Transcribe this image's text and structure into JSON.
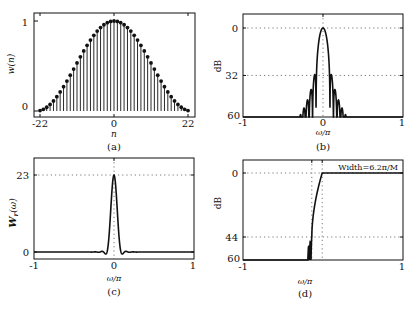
{
  "chart_data": [
    {
      "id": "a",
      "type": "stem",
      "caption": "(a)",
      "title": "",
      "xlabel": "n",
      "ylabel": "w(n)",
      "xlim": [
        -22,
        22
      ],
      "ylim": [
        0,
        1
      ],
      "xticks": [
        -22,
        0,
        22
      ],
      "xtick_labels": [
        "-22",
        "0",
        "22"
      ],
      "yticks": [
        0,
        1
      ],
      "ytick_labels": [
        "0",
        "1"
      ],
      "grid": false,
      "description": "Hann-like window, 45 samples n=-22..22, w(n)=0.5+0.5cos(pi n/23)",
      "n": [
        -22,
        -21,
        -20,
        -19,
        -18,
        -17,
        -16,
        -15,
        -14,
        -13,
        -12,
        -11,
        -10,
        -9,
        -8,
        -7,
        -6,
        -5,
        -4,
        -3,
        -2,
        -1,
        0,
        1,
        2,
        3,
        4,
        5,
        6,
        7,
        8,
        9,
        10,
        11,
        12,
        13,
        14,
        15,
        16,
        17,
        18,
        19,
        20,
        21,
        22
      ],
      "window_M": 23
    },
    {
      "id": "b",
      "type": "line",
      "caption": "(b)",
      "xlabel": "ω/π",
      "ylabel": "dB",
      "xlim": [
        -1,
        1
      ],
      "ylim": [
        60,
        0
      ],
      "xticks": [
        -1,
        0,
        1
      ],
      "xtick_labels": [
        "-1",
        "0",
        "1"
      ],
      "yticks": [
        0,
        32,
        60
      ],
      "ytick_labels": [
        "0",
        "32",
        "60"
      ],
      "grid": "dotted at y=0, y=32, x=0",
      "description": "Log magnitude of window spectrum; main lobe ±0.087π, first sidelobe ≈ -32 dB, clipped at -60 dB beyond |ω/π|≈0.3",
      "mainlobe_halfwidth": 0.087,
      "first_sidelobe_db": -32,
      "floor_db": -60
    },
    {
      "id": "c",
      "type": "line",
      "caption": "(c)",
      "xlabel": "ω/π",
      "ylabel": "W_r(ω)",
      "xlim": [
        -1,
        1
      ],
      "ylim": [
        -2,
        26
      ],
      "xticks": [
        -1,
        0,
        1
      ],
      "xtick_labels": [
        "-1",
        "0",
        "1"
      ],
      "yticks": [
        0,
        23
      ],
      "ytick_labels": [
        "0",
        "23"
      ],
      "grid": "dotted at y=23, y=0, x=0",
      "description": "Real amplitude response of window; peak 23 at ω=0, near zero elsewhere",
      "peak": 23
    },
    {
      "id": "d",
      "type": "line",
      "caption": "(d)",
      "xlabel": "ω/π",
      "ylabel": "dB",
      "xlim": [
        -1,
        1
      ],
      "ylim": [
        60,
        0
      ],
      "xticks": [
        -1,
        1
      ],
      "xtick_labels": [
        "-1",
        "1"
      ],
      "yticks": [
        0,
        44,
        60
      ],
      "ytick_labels": [
        "0",
        "44",
        "60"
      ],
      "grid": "dotted at y=0, y=44, x≈-0.14, x≈-0.01",
      "annotation": "Width=6.2π/M",
      "description": "Lowpass filter log magnitude; stopband attenuation ≈ 44 dB, transition width 6.2π/M, passband 0 dB",
      "transition_start": -0.14,
      "transition_end": -0.01,
      "stopband_db": -44
    }
  ],
  "panels": {
    "a": {
      "caption": "(a)",
      "xlabel": "n",
      "ylabel": "w(n)",
      "yt": [
        "0",
        "1"
      ],
      "xt": [
        "-22",
        "0",
        "22"
      ]
    },
    "b": {
      "caption": "(b)",
      "xlabel": "ω/π",
      "ylabel": "dB",
      "yt": [
        "0",
        "32",
        "60"
      ],
      "xt": [
        "-1",
        "0",
        "1"
      ]
    },
    "c": {
      "caption": "(c)",
      "xlabel": "ω/π",
      "ylabel_main": "W",
      "ylabel_sub": "r",
      "ylabel_arg": "(ω)",
      "yt": [
        "0",
        "23"
      ],
      "xt": [
        "-1",
        "0",
        "1"
      ]
    },
    "d": {
      "caption": "(d)",
      "xlabel": "ω/π",
      "ylabel": "dB",
      "yt": [
        "0",
        "44",
        "60"
      ],
      "xt": [
        "-1",
        "1"
      ],
      "annotation": "Width=6.2π/M"
    }
  }
}
